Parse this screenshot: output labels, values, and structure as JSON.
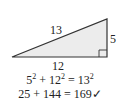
{
  "diagram": {
    "type": "right-triangle",
    "sides": {
      "hypotenuse": "13",
      "vertical_leg": "5",
      "horizontal_leg": "12"
    },
    "right_angle_marker": true,
    "fill_color": "#ececec",
    "stroke_color": "#333333"
  },
  "equations": {
    "line1": {
      "a": "5",
      "a_exp": "2",
      "op1": " + ",
      "b": "12",
      "b_exp": "2",
      "op2": " = ",
      "c": "13",
      "c_exp": "2"
    },
    "line2": {
      "text": "25 + 144 = 169",
      "check": "✓"
    }
  }
}
